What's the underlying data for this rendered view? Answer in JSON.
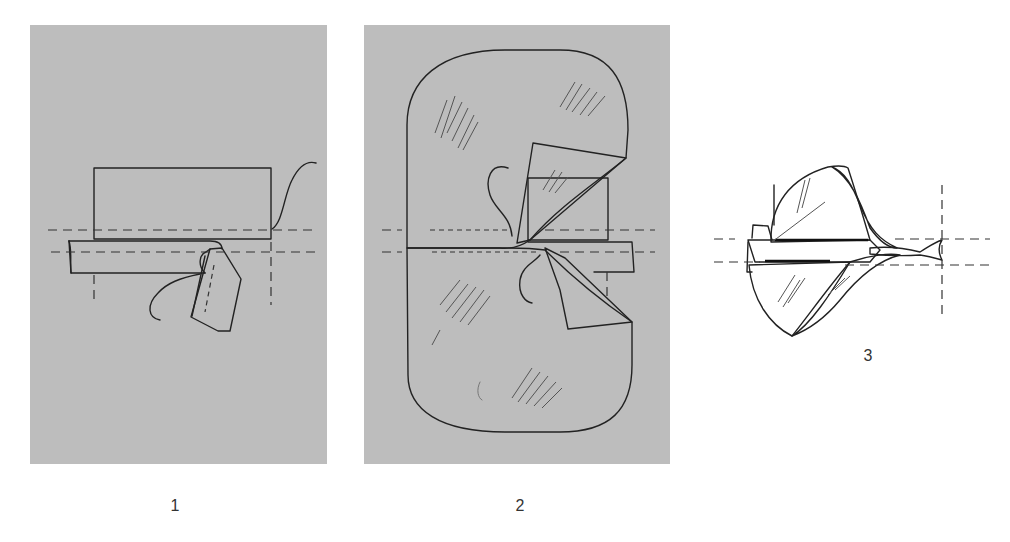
{
  "colors": {
    "background": "#ffffff",
    "panel_gray": "#bdbdbd",
    "fabric_white": "#ffffff",
    "line": "#222222"
  },
  "figures": [
    {
      "id": "step-1",
      "label": "1",
      "description": "Rectangle fabric with folded strip placed along dashed stitching lines, thread looping"
    },
    {
      "id": "step-2",
      "label": "2",
      "description": "Two rounded fabric halves placed over strip with corners folded back"
    },
    {
      "id": "step-3",
      "label": "3",
      "description": "Fabric pieces turned and pulled through, strip ends twisted"
    }
  ]
}
